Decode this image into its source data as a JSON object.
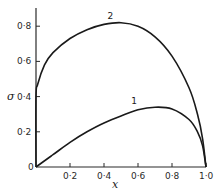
{
  "chart_data": {
    "type": "line",
    "title": "",
    "xlabel": "x",
    "ylabel": "σ",
    "xlim": [
      0,
      1.0
    ],
    "ylim": [
      0,
      0.9
    ],
    "grid": false,
    "legend": "inline curve labels",
    "x_ticks": [
      "0",
      "0·2",
      "0·4",
      "0·6",
      "0·8",
      "1·0"
    ],
    "y_ticks": [
      "0",
      "0·2",
      "0·4",
      "0·6",
      "0·8"
    ],
    "series": [
      {
        "name": "1",
        "x": [
          0,
          0.1,
          0.2,
          0.3,
          0.4,
          0.5,
          0.6,
          0.7,
          0.8,
          0.9,
          0.95,
          0.98,
          1.0
        ],
        "y": [
          0,
          0.07,
          0.14,
          0.2,
          0.25,
          0.29,
          0.325,
          0.34,
          0.33,
          0.27,
          0.2,
          0.12,
          0
        ]
      },
      {
        "name": "2",
        "x": [
          0,
          0.0,
          0.01,
          0.05,
          0.1,
          0.2,
          0.3,
          0.4,
          0.5,
          0.6,
          0.7,
          0.8,
          0.9,
          0.95,
          0.98,
          1.0
        ],
        "y": [
          0,
          0.4,
          0.47,
          0.58,
          0.65,
          0.73,
          0.78,
          0.81,
          0.82,
          0.8,
          0.74,
          0.63,
          0.45,
          0.3,
          0.16,
          0
        ]
      }
    ],
    "annotations": [
      {
        "text": "1",
        "x": 0.56,
        "y": 0.36
      },
      {
        "text": "2",
        "x": 0.42,
        "y": 0.84
      }
    ]
  },
  "axes": {
    "x_label": "x",
    "y_label": "σ"
  },
  "colors": {
    "line": "#1a1a1a",
    "background": "#ffffff"
  }
}
